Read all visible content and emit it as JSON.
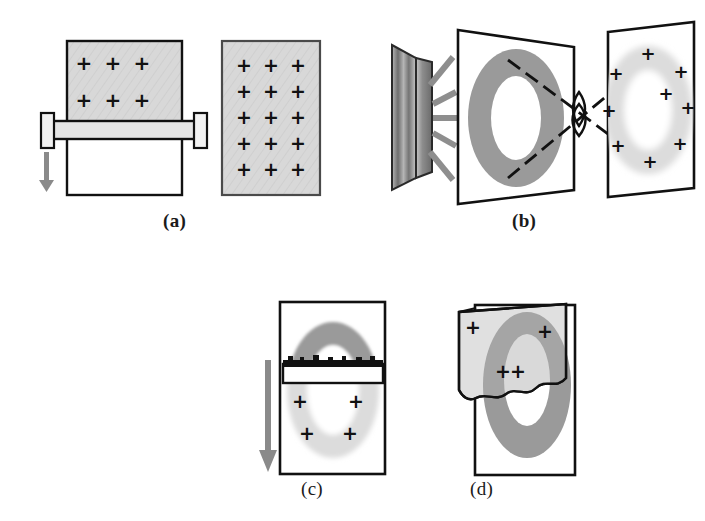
{
  "figure": {
    "background_color": "#ffffff",
    "ink_color": "#111111",
    "gray_fill": "#d2d2d2",
    "mid_gray": "#9a9a9a",
    "light_gray": "#dcdcdc",
    "arrow_color": "#8a8a8a",
    "dash_color": "#8e8e8e"
  },
  "panels": [
    {
      "id": "a",
      "label": "(a)",
      "description": "Squeegee drawing coating down a plate; finished coated plate at right",
      "elements": {
        "left_plate": {
          "name": "coated-plate",
          "coated_region_label": "gray coated upper area",
          "plus_rows": 2,
          "plus_cols": 3,
          "plus_marks": [
            "+",
            "+",
            "+",
            "+",
            "+",
            "+"
          ]
        },
        "squeegee": {
          "name": "squeegee-bar",
          "has_end_caps": true,
          "cap_count": 2
        },
        "arrow": {
          "name": "motion-arrow",
          "direction": "down",
          "color": "#8a8a8a"
        },
        "right_plate": {
          "name": "fully-coated-plate",
          "plus_rows": 5,
          "plus_cols": 3,
          "plus_marks": [
            "+",
            "+",
            "+",
            "+",
            "+",
            "+",
            "+",
            "+",
            "+",
            "+",
            "+",
            "+",
            "+",
            "+",
            "+"
          ]
        }
      }
    },
    {
      "id": "b",
      "label": "(b)",
      "description": "Light source illuminates a ring mask; rays cross at focus and project ring image with charges onto the plate",
      "elements": {
        "light_source": {
          "name": "light-source",
          "panel_count": 2,
          "ray_count": 5
        },
        "mask_plane": {
          "name": "mask-plane",
          "aperture_shape": "annulus",
          "fill": "#9a9a9a"
        },
        "crossing": {
          "name": "ray-crossing-focus",
          "shape": "lens",
          "ray_line_count": 2,
          "style": "dashed"
        },
        "image_plane": {
          "name": "image-plane",
          "ring_shape": "blurred annulus",
          "fill": "#e2e2e2",
          "plus_count": 9,
          "plus_marks": [
            "+",
            "+",
            "+",
            "+",
            "+",
            "+",
            "+",
            "+",
            "+"
          ]
        }
      }
    },
    {
      "id": "c",
      "label": "(c)",
      "description": "Blade sweeps downward across the exposed ring; dark latent ring above blade, light developed ring below with charges",
      "elements": {
        "frame": {
          "name": "substrate-frame"
        },
        "ring_upper": {
          "name": "latent-ring-upper",
          "fill": "#9a9a9a"
        },
        "ring_lower": {
          "name": "developed-ring-lower",
          "fill": "#dcdcdc"
        },
        "blade": {
          "name": "blade-bar",
          "edge": "rough-textured-top-edge"
        },
        "arrow": {
          "name": "motion-arrow",
          "direction": "down",
          "color": "#8a8a8a"
        },
        "plus_count": 4,
        "plus_marks": [
          "+",
          "+",
          "+",
          "+"
        ]
      }
    },
    {
      "id": "d",
      "label": "(d)",
      "description": "Charged film strip peeled off from the substrate carrying the ring pattern",
      "elements": {
        "frame": {
          "name": "substrate-frame"
        },
        "ring": {
          "name": "transferred-ring",
          "fill": "#9a9a9a"
        },
        "peeled_strip": {
          "name": "peeled-film-strip",
          "fill": "#dcdcdc",
          "bottom_edge": "wavy-curl"
        },
        "plus_count": 4,
        "plus_marks": [
          "+",
          "+",
          "+",
          "+"
        ]
      }
    }
  ]
}
